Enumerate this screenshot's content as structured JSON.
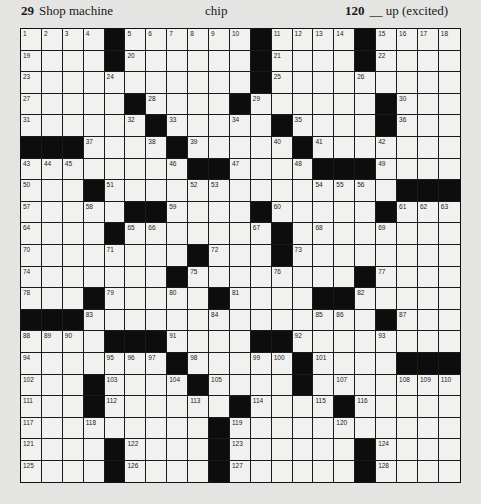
{
  "header_clues": [
    {
      "number": "29",
      "text": "Shop machine"
    },
    {
      "number": "",
      "text": "chip"
    },
    {
      "number": "120",
      "text": "__ up (excited)"
    }
  ],
  "grid": {
    "rows": 21,
    "cols": 21,
    "layout": [
      "....#......#....#....",
      "....#......#....#....",
      "...........#.........",
      ".....#....#......#...",
      "......#.....#....#...",
      "###....#.....#.......",
      "........##....###....",
      "...#..............###",
      ".....##....#.....#...",
      "....#.......#........",
      "........#...#........",
      ".......#........#....",
      "...#.....#....##.....",
      "###..............#...",
      "....###....##........",
      ".......#.....#....###",
      "...#....#....#.......",
      "...#......#....#.....",
      ".........#...........",
      "....#....#......#....",
      "....#....#......#...."
    ],
    "numbers": [
      {
        "r": 0,
        "c": 0,
        "n": "1"
      },
      {
        "r": 0,
        "c": 1,
        "n": "2"
      },
      {
        "r": 0,
        "c": 2,
        "n": "3"
      },
      {
        "r": 0,
        "c": 3,
        "n": "4"
      },
      {
        "r": 0,
        "c": 5,
        "n": "5"
      },
      {
        "r": 0,
        "c": 6,
        "n": "6"
      },
      {
        "r": 0,
        "c": 7,
        "n": "7"
      },
      {
        "r": 0,
        "c": 8,
        "n": "8"
      },
      {
        "r": 0,
        "c": 9,
        "n": "9"
      },
      {
        "r": 0,
        "c": 10,
        "n": "10"
      },
      {
        "r": 0,
        "c": 12,
        "n": "11"
      },
      {
        "r": 0,
        "c": 13,
        "n": "12"
      },
      {
        "r": 0,
        "c": 14,
        "n": "13"
      },
      {
        "r": 0,
        "c": 15,
        "n": "14"
      },
      {
        "r": 0,
        "c": 17,
        "n": "15"
      },
      {
        "r": 0,
        "c": 18,
        "n": "16"
      },
      {
        "r": 0,
        "c": 19,
        "n": "17"
      },
      {
        "r": 0,
        "c": 20,
        "n": "18"
      },
      {
        "r": 1,
        "c": 0,
        "n": "19"
      },
      {
        "r": 1,
        "c": 5,
        "n": "20"
      },
      {
        "r": 1,
        "c": 12,
        "n": "21"
      },
      {
        "r": 1,
        "c": 17,
        "n": "22"
      },
      {
        "r": 2,
        "c": 0,
        "n": "23"
      },
      {
        "r": 2,
        "c": 4,
        "n": "24"
      },
      {
        "r": 2,
        "c": 12,
        "n": "25"
      },
      {
        "r": 2,
        "c": 16,
        "n": "26"
      },
      {
        "r": 3,
        "c": 0,
        "n": "27"
      },
      {
        "r": 3,
        "c": 6,
        "n": "28"
      },
      {
        "r": 3,
        "c": 11,
        "n": "29"
      },
      {
        "r": 3,
        "c": 18,
        "n": "30"
      },
      {
        "r": 4,
        "c": 0,
        "n": "31"
      },
      {
        "r": 4,
        "c": 5,
        "n": "32"
      },
      {
        "r": 4,
        "c": 7,
        "n": "33"
      },
      {
        "r": 4,
        "c": 10,
        "n": "34"
      },
      {
        "r": 4,
        "c": 13,
        "n": "35"
      },
      {
        "r": 4,
        "c": 18,
        "n": "36"
      },
      {
        "r": 5,
        "c": 3,
        "n": "37"
      },
      {
        "r": 5,
        "c": 6,
        "n": "38"
      },
      {
        "r": 5,
        "c": 8,
        "n": "39"
      },
      {
        "r": 5,
        "c": 12,
        "n": "40"
      },
      {
        "r": 5,
        "c": 14,
        "n": "41"
      },
      {
        "r": 5,
        "c": 17,
        "n": "42"
      },
      {
        "r": 6,
        "c": 0,
        "n": "43"
      },
      {
        "r": 6,
        "c": 1,
        "n": "44"
      },
      {
        "r": 6,
        "c": 2,
        "n": "45"
      },
      {
        "r": 6,
        "c": 7,
        "n": "46"
      },
      {
        "r": 6,
        "c": 10,
        "n": "47"
      },
      {
        "r": 6,
        "c": 13,
        "n": "48"
      },
      {
        "r": 6,
        "c": 17,
        "n": "49"
      },
      {
        "r": 7,
        "c": 0,
        "n": "50"
      },
      {
        "r": 7,
        "c": 4,
        "n": "51"
      },
      {
        "r": 7,
        "c": 8,
        "n": "52"
      },
      {
        "r": 7,
        "c": 9,
        "n": "53"
      },
      {
        "r": 7,
        "c": 14,
        "n": "54"
      },
      {
        "r": 7,
        "c": 15,
        "n": "55"
      },
      {
        "r": 7,
        "c": 16,
        "n": "56"
      },
      {
        "r": 8,
        "c": 0,
        "n": "57"
      },
      {
        "r": 8,
        "c": 3,
        "n": "58"
      },
      {
        "r": 8,
        "c": 7,
        "n": "59"
      },
      {
        "r": 8,
        "c": 12,
        "n": "60"
      },
      {
        "r": 8,
        "c": 18,
        "n": "61"
      },
      {
        "r": 8,
        "c": 19,
        "n": "62"
      },
      {
        "r": 8,
        "c": 20,
        "n": "63"
      },
      {
        "r": 9,
        "c": 0,
        "n": "64"
      },
      {
        "r": 9,
        "c": 5,
        "n": "65"
      },
      {
        "r": 9,
        "c": 6,
        "n": "66"
      },
      {
        "r": 9,
        "c": 11,
        "n": "67"
      },
      {
        "r": 9,
        "c": 14,
        "n": "68"
      },
      {
        "r": 9,
        "c": 17,
        "n": "69"
      },
      {
        "r": 10,
        "c": 0,
        "n": "70"
      },
      {
        "r": 10,
        "c": 4,
        "n": "71"
      },
      {
        "r": 10,
        "c": 9,
        "n": "72"
      },
      {
        "r": 10,
        "c": 13,
        "n": "73"
      },
      {
        "r": 11,
        "c": 0,
        "n": "74"
      },
      {
        "r": 11,
        "c": 8,
        "n": "75"
      },
      {
        "r": 11,
        "c": 12,
        "n": "76"
      },
      {
        "r": 11,
        "c": 17,
        "n": "77"
      },
      {
        "r": 12,
        "c": 0,
        "n": "78"
      },
      {
        "r": 12,
        "c": 4,
        "n": "79"
      },
      {
        "r": 12,
        "c": 7,
        "n": "80"
      },
      {
        "r": 12,
        "c": 10,
        "n": "81"
      },
      {
        "r": 12,
        "c": 16,
        "n": "82"
      },
      {
        "r": 13,
        "c": 3,
        "n": "83"
      },
      {
        "r": 13,
        "c": 9,
        "n": "84"
      },
      {
        "r": 13,
        "c": 14,
        "n": "85"
      },
      {
        "r": 13,
        "c": 15,
        "n": "86"
      },
      {
        "r": 13,
        "c": 18,
        "n": "87"
      },
      {
        "r": 14,
        "c": 0,
        "n": "88"
      },
      {
        "r": 14,
        "c": 1,
        "n": "89"
      },
      {
        "r": 14,
        "c": 2,
        "n": "90"
      },
      {
        "r": 14,
        "c": 7,
        "n": "91"
      },
      {
        "r": 14,
        "c": 13,
        "n": "92"
      },
      {
        "r": 14,
        "c": 17,
        "n": "93"
      },
      {
        "r": 15,
        "c": 0,
        "n": "94"
      },
      {
        "r": 15,
        "c": 4,
        "n": "95"
      },
      {
        "r": 15,
        "c": 5,
        "n": "96"
      },
      {
        "r": 15,
        "c": 6,
        "n": "97"
      },
      {
        "r": 15,
        "c": 8,
        "n": "98"
      },
      {
        "r": 15,
        "c": 11,
        "n": "99"
      },
      {
        "r": 15,
        "c": 12,
        "n": "100"
      },
      {
        "r": 15,
        "c": 14,
        "n": "101"
      },
      {
        "r": 16,
        "c": 0,
        "n": "102"
      },
      {
        "r": 16,
        "c": 4,
        "n": "103"
      },
      {
        "r": 16,
        "c": 7,
        "n": "104"
      },
      {
        "r": 16,
        "c": 9,
        "n": "105"
      },
      {
        "r": 16,
        "c": 13,
        "n": "106"
      },
      {
        "r": 16,
        "c": 15,
        "n": "107"
      },
      {
        "r": 16,
        "c": 18,
        "n": "108"
      },
      {
        "r": 16,
        "c": 19,
        "n": "109"
      },
      {
        "r": 16,
        "c": 20,
        "n": "110"
      },
      {
        "r": 17,
        "c": 0,
        "n": "111"
      },
      {
        "r": 17,
        "c": 4,
        "n": "112"
      },
      {
        "r": 17,
        "c": 8,
        "n": "113"
      },
      {
        "r": 17,
        "c": 11,
        "n": "114"
      },
      {
        "r": 17,
        "c": 14,
        "n": "115"
      },
      {
        "r": 17,
        "c": 16,
        "n": "116"
      },
      {
        "r": 18,
        "c": 0,
        "n": "117"
      },
      {
        "r": 18,
        "c": 3,
        "n": "118"
      },
      {
        "r": 18,
        "c": 10,
        "n": "119"
      },
      {
        "r": 18,
        "c": 15,
        "n": "120"
      },
      {
        "r": 19,
        "c": 0,
        "n": "121"
      },
      {
        "r": 19,
        "c": 5,
        "n": "122"
      },
      {
        "r": 19,
        "c": 10,
        "n": "123"
      },
      {
        "r": 19,
        "c": 17,
        "n": "124"
      },
      {
        "r": 20,
        "c": 0,
        "n": "125"
      },
      {
        "r": 20,
        "c": 5,
        "n": "126"
      },
      {
        "r": 20,
        "c": 10,
        "n": "127"
      },
      {
        "r": 20,
        "c": 17,
        "n": "128"
      }
    ]
  },
  "colors": {
    "page": "#e4e4e2",
    "cell": "#f1f1ef",
    "black": "#0d0d0d"
  }
}
